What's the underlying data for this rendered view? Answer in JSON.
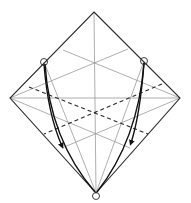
{
  "diagram": {
    "type": "origami-fold-diagram",
    "colors": {
      "outline": "#2a2a2a",
      "crease": "#9a9a9a",
      "valley": "#2a2a2a",
      "arrow": "#111111",
      "background": "#ffffff"
    },
    "outline_points": [
      [
        94,
        12
      ],
      [
        180,
        98
      ],
      [
        96,
        193
      ],
      [
        10,
        98
      ]
    ],
    "reference_circles": [
      {
        "name": "left-corner-marker",
        "cx": 44,
        "cy": 62,
        "r": 3.5
      },
      {
        "name": "right-corner-marker",
        "cx": 144,
        "cy": 61,
        "r": 3.5
      },
      {
        "name": "bottom-point-marker",
        "cx": 96,
        "cy": 196,
        "r": 3.5
      }
    ],
    "arrows": [
      {
        "name": "left-fold-arrow-inner",
        "direction": "down"
      },
      {
        "name": "left-fold-arrow-outer",
        "direction": "down"
      },
      {
        "name": "right-fold-arrow-inner",
        "direction": "down"
      },
      {
        "name": "right-fold-arrow-outer",
        "direction": "down"
      }
    ]
  }
}
